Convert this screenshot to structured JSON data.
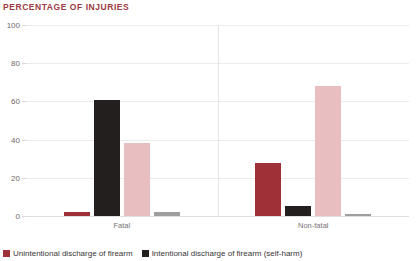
{
  "chart_data": {
    "type": "bar",
    "title": "PERCENTAGE OF INJURIES",
    "xlabel": "",
    "ylabel": "",
    "ylim": [
      0,
      100
    ],
    "yticks": [
      0,
      20,
      40,
      60,
      80,
      100
    ],
    "grid": true,
    "legend_position": "bottom-left",
    "categories": [
      "Fatal",
      "Non-fatal"
    ],
    "series": [
      {
        "name": "Unintentional discharge of firearm",
        "color": "#A03038",
        "values": [
          2,
          28
        ]
      },
      {
        "name": "Intentional discharge of firearm (self-harm)",
        "color": "#231F1F",
        "values": [
          61,
          5
        ]
      },
      {
        "name": "Assault by firearm",
        "color": "#E8BEC0",
        "values": [
          38,
          68
        ]
      },
      {
        "name": "Undetermined intent",
        "color": "#9E9E9E",
        "values": [
          2,
          1
        ]
      }
    ]
  },
  "legend": {
    "items": [
      {
        "label": "Unintentional discharge of firearm",
        "color": "#A03038"
      },
      {
        "label": "Intentional discharge of firearm (self-harm)",
        "color": "#231F1F"
      }
    ]
  },
  "colors": {
    "title": "#9C3B44",
    "gridline": "#EDEAEA",
    "axis_text": "#6E6A6A",
    "background": "#ffffff"
  }
}
